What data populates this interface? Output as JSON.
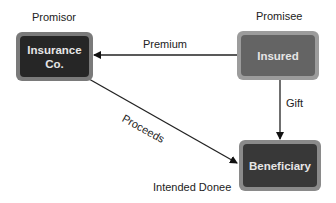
{
  "diagram": {
    "nodes": {
      "insurer": {
        "label_line1": "Insurance",
        "label_line2": "Co.",
        "role": "Promisor",
        "fill": "#2a2a2a",
        "border": "#777777"
      },
      "insured": {
        "label": "Insured",
        "role": "Promisee",
        "fill": "#666666",
        "border": "#9a9a9a"
      },
      "beneficiary": {
        "label": "Beneficiary",
        "role": "Intended Donee",
        "fill": "#3a3a3a",
        "border": "#8a8a8a"
      }
    },
    "edges": {
      "premium": {
        "label": "Premium",
        "from": "Insured",
        "to": "Insurance Co."
      },
      "gift": {
        "label": "Gift",
        "from": "Insured",
        "to": "Beneficiary"
      },
      "proceeds": {
        "label": "Proceeds",
        "from": "Insurance Co.",
        "to": "Beneficiary"
      }
    }
  }
}
